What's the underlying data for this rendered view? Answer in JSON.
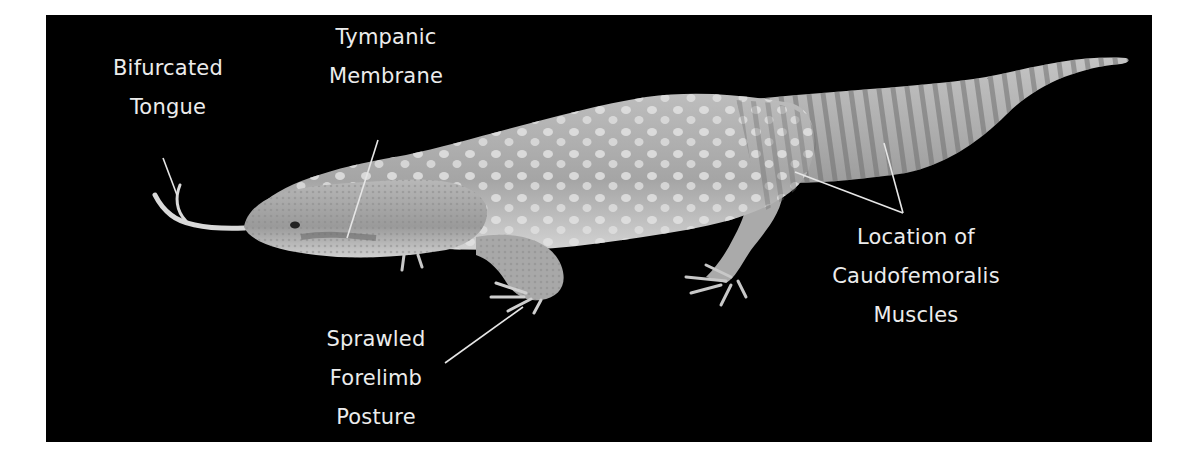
{
  "figure": {
    "background_color": "#000000",
    "label_color": "#ececec",
    "line_color": "#e6e6e6"
  },
  "labels": {
    "tongue": {
      "line1": "Bifurcated",
      "line2": "Tongue"
    },
    "tympanic": {
      "line1": "Tympanic",
      "line2": "Membrane"
    },
    "forelimb": {
      "line1": "Sprawled",
      "line2": "Forelimb",
      "line3": "Posture"
    },
    "caudofemoralis": {
      "line1": "Location of",
      "line2": "Caudofemoralis",
      "line3": "Muscles"
    }
  }
}
